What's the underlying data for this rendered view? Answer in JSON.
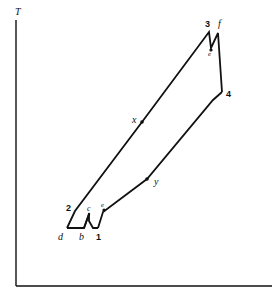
{
  "figure": {
    "type": "T-s diagram (gas turbine cycle with intercooling and reheat)",
    "axis": {
      "y_label": "T",
      "x_label": ""
    },
    "points": [
      {
        "id": "1",
        "label": "1",
        "style": "bold"
      },
      {
        "id": "2",
        "label": "2",
        "style": "bold"
      },
      {
        "id": "3",
        "label": "3",
        "style": "bold"
      },
      {
        "id": "4",
        "label": "4",
        "style": "bold"
      },
      {
        "id": "b",
        "label": "b",
        "style": "italic"
      },
      {
        "id": "c",
        "label": "c",
        "style": "italic"
      },
      {
        "id": "d",
        "label": "d",
        "style": "italic"
      },
      {
        "id": "e_low",
        "label": "e",
        "style": "italic"
      },
      {
        "id": "e_high",
        "label": "e",
        "style": "italic"
      },
      {
        "id": "f",
        "label": "f",
        "style": "italic"
      },
      {
        "id": "x",
        "label": "x",
        "style": "italic"
      },
      {
        "id": "y",
        "label": "y",
        "style": "italic"
      }
    ],
    "labels": {
      "T": "T",
      "p1": "1",
      "p2": "2",
      "p3": "3",
      "p4": "4",
      "pb": "b",
      "pc": "c",
      "pd": "d",
      "pe": "e",
      "pf": "f",
      "px": "x",
      "py": "y"
    },
    "line_color": "#111111"
  }
}
